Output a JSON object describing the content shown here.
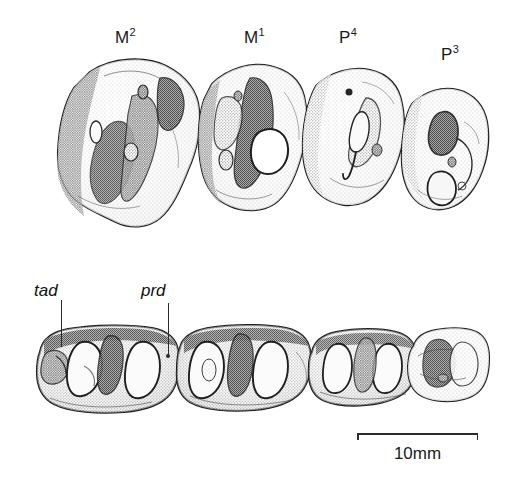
{
  "figure": {
    "caption_absent": true,
    "background_color": "#ffffff",
    "ink_color": "#2b2b2b"
  },
  "upper_row": {
    "name": "upper-tooth-row",
    "view": "occlusal",
    "teeth": [
      {
        "label_text": "M",
        "label_superscript": "2",
        "label_x": 126,
        "label_y": 28
      },
      {
        "label_text": "M",
        "label_superscript": "1",
        "label_x": 255,
        "label_y": 28
      },
      {
        "label_text": "P",
        "label_superscript": "4",
        "label_x": 350,
        "label_y": 28
      },
      {
        "label_text": "P",
        "label_superscript": "3",
        "label_x": 452,
        "label_y": 45
      }
    ]
  },
  "lower_row": {
    "name": "lower-tooth-row",
    "view": "occlusal",
    "annotations": [
      {
        "label": "tad",
        "label_x": 34,
        "label_y": 281,
        "leader_x": 61,
        "leader_top": 300,
        "leader_bottom": 347
      },
      {
        "label": "prd",
        "label_x": 141,
        "label_y": 281,
        "leader_x": 168,
        "leader_top": 303,
        "leader_bottom": 356
      }
    ]
  },
  "scale": {
    "label": "10mm",
    "bar_left": 357,
    "bar_right": 478,
    "bar_y": 433,
    "tick_height": 7,
    "text_x": 357,
    "text_y": 444,
    "text_width": 121
  }
}
